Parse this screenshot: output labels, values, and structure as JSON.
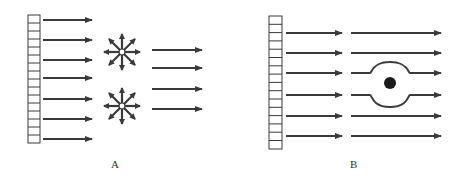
{
  "colors": {
    "stroke": "#3a3a3a",
    "dot": "#1a1a1a",
    "background": "#ffffff"
  },
  "panels": [
    {
      "id": "A",
      "label": "A",
      "description": "Plane wave from grating hits two point sources emitting in all directions; transmitted parallel arrows",
      "grating_cells": 16,
      "incoming_arrows": 7,
      "scatterers": 2,
      "scatterer_type": "star-burst (8 directions)",
      "outgoing_arrows": 4
    },
    {
      "id": "B",
      "label": "B",
      "description": "Plane wave from grating; wavefronts bend around a solid obstacle (dot) and continue",
      "grating_cells": 16,
      "incoming_arrows": 6,
      "obstacle": "filled circle",
      "outgoing_arrows": 6
    }
  ]
}
